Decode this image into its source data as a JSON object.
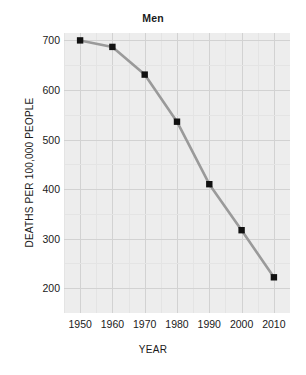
{
  "chart_data": {
    "type": "line",
    "title": "Men",
    "xlabel": "YEAR",
    "ylabel": "DEATHS PER 100,000 PEOPLE",
    "x": [
      1950,
      1960,
      1970,
      1980,
      1990,
      2000,
      2010
    ],
    "values": [
      700,
      687,
      631,
      536,
      410,
      317,
      222
    ],
    "categories": [
      "1950",
      "1960",
      "1970",
      "1980",
      "1990",
      "2000",
      "2010"
    ],
    "series": [
      {
        "name": "Men",
        "values": [
          700,
          687,
          631,
          536,
          410,
          317,
          222
        ]
      }
    ],
    "xlim": [
      1945,
      2015
    ],
    "ylim": [
      150,
      715
    ],
    "xticks": [
      1950,
      1960,
      1970,
      1980,
      1990,
      2000,
      2010
    ],
    "xtick_labels": [
      "1950",
      "1960",
      "1970",
      "1980",
      "1990",
      "2000",
      "2010"
    ],
    "yticks": [
      200,
      300,
      400,
      500,
      600,
      700
    ],
    "ytick_labels": [
      "700",
      "600",
      "500",
      "400",
      "300",
      "200"
    ],
    "grid": true,
    "minor_grid": true,
    "legend": false,
    "line_color": "#9a9a9a",
    "marker_color": "#111111",
    "marker_shape": "square",
    "plot_background": "#ededed",
    "figure_background": "#ffffff",
    "gridline_color": "#d2d2d2",
    "text_color": "#1a1a1a"
  },
  "axes": {
    "y": {
      "labels": [
        "700",
        "600",
        "500",
        "400",
        "300",
        "200"
      ],
      "title": "DEATHS PER 100,000 PEOPLE"
    },
    "x": {
      "labels": [
        "1950",
        "1960",
        "1970",
        "1980",
        "1990",
        "2000",
        "2010"
      ],
      "title": "YEAR"
    }
  },
  "header": {
    "title": "Men"
  }
}
